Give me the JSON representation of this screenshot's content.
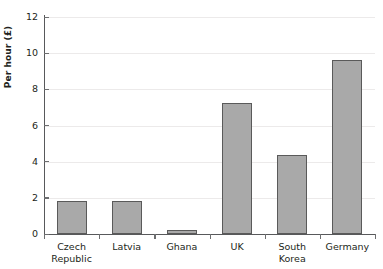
{
  "chart_data": {
    "type": "bar",
    "title": "",
    "xlabel": "",
    "ylabel": "Per hour (£)",
    "categories": [
      "Czech Republic",
      "Latvia",
      "Ghana",
      "UK",
      "South Korea",
      "Germany"
    ],
    "category_lines": [
      [
        "Czech",
        "Republic"
      ],
      [
        "Latvia"
      ],
      [
        "Ghana"
      ],
      [
        "UK"
      ],
      [
        "South",
        "Korea"
      ],
      [
        "Germany"
      ]
    ],
    "values": [
      1.85,
      1.8,
      0.2,
      7.25,
      4.35,
      9.6
    ],
    "ylim": [
      0,
      12
    ],
    "ytick_step": 2,
    "yticks": [
      0,
      2,
      4,
      6,
      8,
      10,
      12
    ],
    "ytick_labels": [
      "0",
      "2",
      "4",
      "6",
      "8",
      "10",
      "12"
    ],
    "grid": true,
    "grid_axis": "y",
    "legend": false,
    "legend_position": "none",
    "bar_color": "#a9a9a9",
    "bar_border_color": "#5a5a5a",
    "gridline_color": "#eceaea",
    "axis_color": "#58595b",
    "background_color": "#ffffff"
  }
}
